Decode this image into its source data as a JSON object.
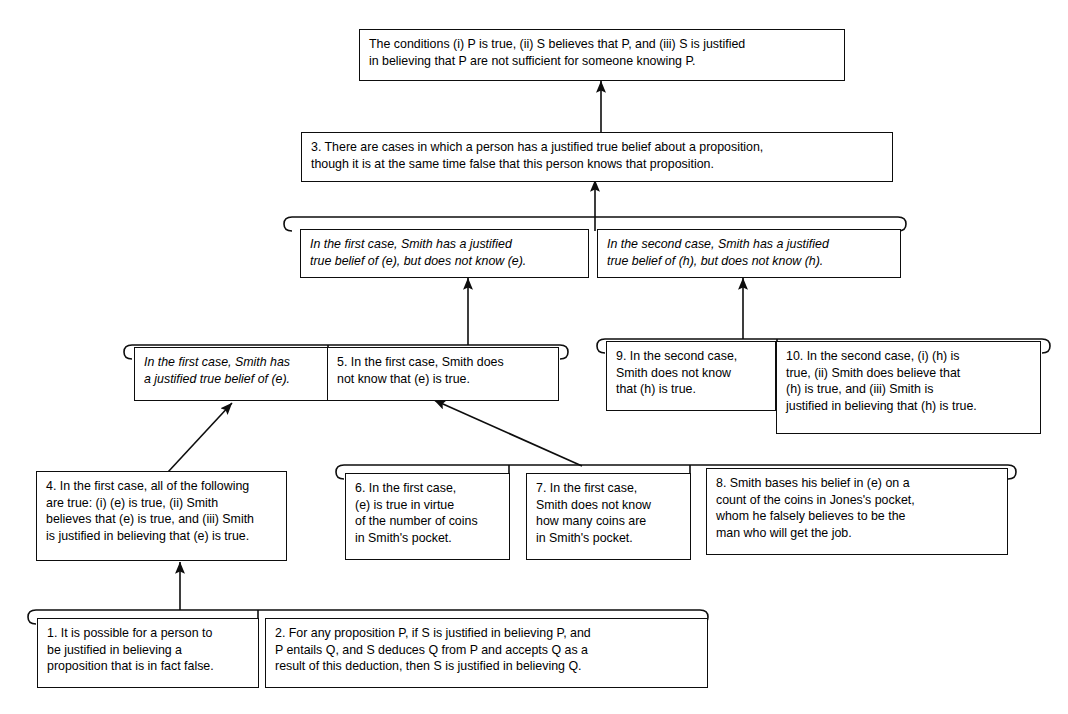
{
  "diagram": {
    "background": "#ffffff",
    "ink": "#0d0d0d",
    "nodes": {
      "conclusion": "The conditions (i) P is true, (ii) S believes that P, and (iii) S is justified\nin believing that P are not sufficient for someone knowing P.",
      "n3": "3. There are cases in which a person has a justified true belief about a proposition,\nthough it is at the same time false that this person knows that proposition.",
      "first_case_summary": "In the first case, Smith has a justified\ntrue belief of (e), but does not know (e).",
      "second_case_summary": "In the second case, Smith has a justified\ntrue belief of (h), but does not know (h).",
      "first_case_jtb": "In the first case, Smith has\na justified true belief of (e).",
      "n5": "5. In the first case, Smith does\nnot know that (e) is true.",
      "n9": "9. In the second case,\nSmith does not know\nthat (h) is true.",
      "n10": "10. In the second case, (i) (h) is\ntrue, (ii)  Smith does believe that\n(h) is true, and (iii) Smith is\njustified in believing that (h) is true.",
      "n4": "4. In the first case, all of the following\nare true: (i) (e) is true, (ii) Smith\nbelieves that (e) is true, and (iii) Smith\nis justified in believing that (e) is true.",
      "n6": "6. In the first case,\n(e) is true in virtue\nof the number of coins\nin Smith's pocket.",
      "n7": "7. In the first case,\nSmith does not know\nhow many coins are\nin Smith's pocket.",
      "n8": "8. Smith bases his belief in (e) on a\ncount of the coins in Jones's pocket,\nwhom he falsely believes to be the\nman who will get the job.",
      "n1": "1. It is possible for a person to\nbe justified in believing a\nproposition that is in fact false.",
      "n2": "2. For any proposition P, if S is justified in believing P, and\nP entails Q, and S deduces Q from P and accepts Q as a\nresult of this deduction, then S is justified in believing Q."
    }
  }
}
